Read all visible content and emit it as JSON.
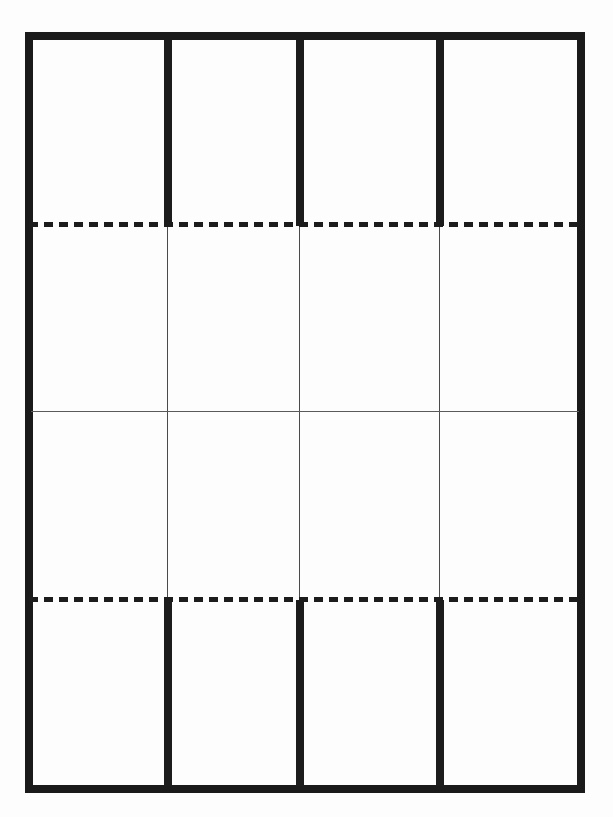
{
  "figure": {
    "name": "blank-four-by-four-grid-diagram",
    "page_background_color": "#fdfdfd",
    "ink_color": "#1a1a1a",
    "hairline_color": "#5a5a5a",
    "columns": 4,
    "rows": 4,
    "border_thickness_px": 8,
    "hairline_thickness_px": 1,
    "dash_length_px": 9,
    "dash_gap_px": 6,
    "frame": {
      "left_px": 25,
      "top_px": 32,
      "right_px": 585,
      "bottom_px": 793
    },
    "column_divider_x_px": [
      168,
      300,
      440
    ],
    "row_divider_y_px": [
      225,
      411,
      600
    ],
    "row_divider_styles": [
      "dashed",
      "solid-hairline",
      "dashed"
    ],
    "labels": {
      "top_band": "",
      "upper_middle_band": "",
      "lower_middle_band": "",
      "bottom_band": ""
    },
    "cell_contents": [
      [
        "",
        "",
        "",
        ""
      ],
      [
        "",
        "",
        "",
        ""
      ],
      [
        "",
        "",
        "",
        ""
      ],
      [
        "",
        "",
        "",
        ""
      ]
    ]
  }
}
